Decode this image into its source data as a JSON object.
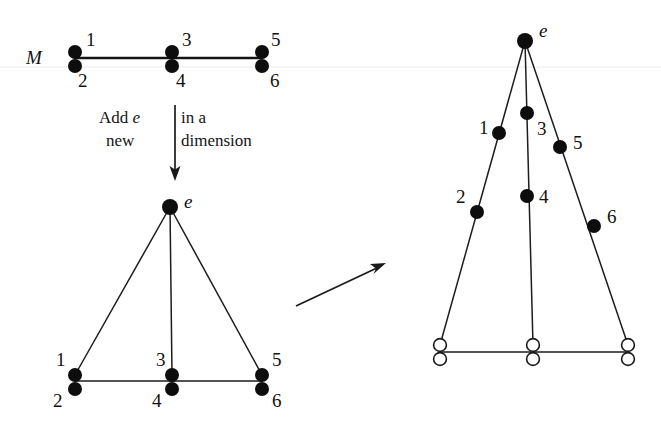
{
  "figure": {
    "background_color": "#ffffff",
    "ink_color": "#111111",
    "width": 661,
    "height": 424
  },
  "labels": {
    "matroid_M": "M",
    "element_e_middle": "e",
    "element_e_right": "e",
    "caption_line1_left": "Add ",
    "caption_line1_italic": "e",
    "caption_line1_right": " in a",
    "caption_line2_left": "new",
    "caption_line2_right": "dimension",
    "transform_arrow": "→"
  },
  "panels": [
    {
      "id": "panel-top-left",
      "name": "matroid-M",
      "label": "M",
      "description": "Rank-2 matroid: three parallel pairs on a line",
      "points": [
        {
          "id": "1",
          "label": "1",
          "style": "filled",
          "x": 75,
          "y": 52
        },
        {
          "id": "2",
          "label": "2",
          "style": "filled",
          "x": 75,
          "y": 65
        },
        {
          "id": "3",
          "label": "3",
          "style": "filled",
          "x": 172,
          "y": 52
        },
        {
          "id": "4",
          "label": "4",
          "style": "filled",
          "x": 172,
          "y": 65
        },
        {
          "id": "5",
          "label": "5",
          "style": "filled",
          "x": 262,
          "y": 52
        },
        {
          "id": "6",
          "label": "6",
          "style": "filled",
          "x": 262,
          "y": 65
        }
      ],
      "lines": [
        {
          "from": "1",
          "to": "5",
          "x1": 75,
          "y1": 58,
          "x2": 262,
          "y2": 58
        }
      ]
    },
    {
      "id": "panel-middle",
      "name": "cone-over-M",
      "label": "e",
      "description": "Free extension: apex e joined to the line of M",
      "points": [
        {
          "id": "e",
          "label": "e",
          "style": "filled",
          "x": 170,
          "y": 207
        },
        {
          "id": "1",
          "label": "1",
          "style": "filled",
          "x": 75,
          "y": 375
        },
        {
          "id": "2",
          "label": "2",
          "style": "filled",
          "x": 75,
          "y": 388
        },
        {
          "id": "3",
          "label": "3",
          "style": "filled",
          "x": 172,
          "y": 375
        },
        {
          "id": "4",
          "label": "4",
          "style": "filled",
          "x": 172,
          "y": 388
        },
        {
          "id": "5",
          "label": "5",
          "style": "filled",
          "x": 262,
          "y": 375
        },
        {
          "id": "6",
          "label": "6",
          "style": "filled",
          "x": 262,
          "y": 388
        }
      ],
      "lines": [
        {
          "from": "e",
          "to": "1",
          "x1": 170,
          "y1": 207,
          "x2": 75,
          "y2": 375
        },
        {
          "from": "e",
          "to": "3",
          "x1": 170,
          "y1": 207,
          "x2": 172,
          "y2": 375
        },
        {
          "from": "e",
          "to": "5",
          "x1": 170,
          "y1": 207,
          "x2": 262,
          "y2": 375
        },
        {
          "from": "1",
          "to": "5",
          "x1": 75,
          "y1": 381,
          "x2": 262,
          "y2": 381
        }
      ]
    },
    {
      "id": "panel-right",
      "name": "projected-configuration",
      "label": "e",
      "description": "Points 1-6 moved onto the three legs; hollow points on the base line",
      "points": [
        {
          "id": "e",
          "label": "e",
          "style": "filled",
          "x": 525,
          "y": 41
        },
        {
          "id": "1",
          "label": "1",
          "style": "filled",
          "x": 499,
          "y": 133
        },
        {
          "id": "3",
          "label": "3",
          "style": "filled",
          "x": 527,
          "y": 113
        },
        {
          "id": "5",
          "label": "5",
          "style": "filled",
          "x": 560,
          "y": 147
        },
        {
          "id": "2",
          "label": "2",
          "style": "filled",
          "x": 477,
          "y": 212
        },
        {
          "id": "4",
          "label": "4",
          "style": "filled",
          "x": 527,
          "y": 196
        },
        {
          "id": "6",
          "label": "6",
          "style": "filled",
          "x": 594,
          "y": 226
        }
      ],
      "base_points": [
        {
          "id": "b1",
          "style": "hollow",
          "x": 440,
          "y": 345
        },
        {
          "id": "b2",
          "style": "hollow",
          "x": 440,
          "y": 359
        },
        {
          "id": "b3",
          "style": "hollow",
          "x": 533,
          "y": 345
        },
        {
          "id": "b4",
          "style": "hollow",
          "x": 533,
          "y": 359
        },
        {
          "id": "b5",
          "style": "hollow",
          "x": 628,
          "y": 345
        },
        {
          "id": "b6",
          "style": "hollow",
          "x": 628,
          "y": 359
        }
      ],
      "lines": [
        {
          "from": "e",
          "to": "b1",
          "x1": 525,
          "y1": 41,
          "x2": 440,
          "y2": 345
        },
        {
          "from": "e",
          "to": "b3",
          "x1": 525,
          "y1": 41,
          "x2": 533,
          "y2": 345
        },
        {
          "from": "e",
          "to": "b5",
          "x1": 525,
          "y1": 41,
          "x2": 628,
          "y2": 345
        },
        {
          "from": "b1",
          "to": "b5",
          "x1": 440,
          "y1": 352,
          "x2": 628,
          "y2": 352
        }
      ]
    }
  ],
  "arrows": [
    {
      "id": "down-arrow",
      "name": "add-e-arrow",
      "direction": "down",
      "x1": 175,
      "y1": 105,
      "x2": 175,
      "y2": 178
    },
    {
      "id": "diagonal-arrow",
      "name": "transform-arrow",
      "direction": "up-right",
      "x1": 296,
      "y1": 306,
      "x2": 386,
      "y2": 264
    }
  ]
}
